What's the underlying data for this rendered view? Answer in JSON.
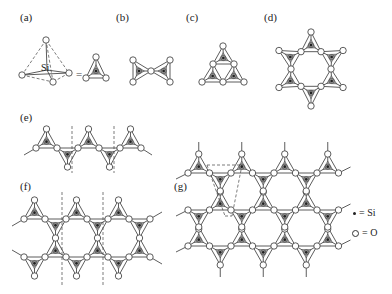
{
  "figure": {
    "panels": [
      {
        "id": "a",
        "label": "(a)",
        "x": 20,
        "y": 12,
        "description": "SiO4 tetrahedron"
      },
      {
        "id": "b",
        "label": "(b)",
        "x": 116,
        "y": 12,
        "description": "Si2O7 pair"
      },
      {
        "id": "c",
        "label": "(c)",
        "x": 186,
        "y": 12,
        "description": "Si3O9 ring"
      },
      {
        "id": "d",
        "label": "(d)",
        "x": 264,
        "y": 12,
        "description": "Si6O18 ring"
      },
      {
        "id": "e",
        "label": "(e)",
        "x": 20,
        "y": 112,
        "description": "single chain"
      },
      {
        "id": "f",
        "label": "(f)",
        "x": 20,
        "y": 181,
        "description": "double chain"
      },
      {
        "id": "g",
        "label": "(g)",
        "x": 174,
        "y": 181,
        "description": "sheet"
      }
    ],
    "si_label": "Si",
    "equals": "=",
    "legend": [
      {
        "symbol": "dot",
        "text": "= Si"
      },
      {
        "symbol": "ring",
        "text": "= O"
      }
    ]
  }
}
